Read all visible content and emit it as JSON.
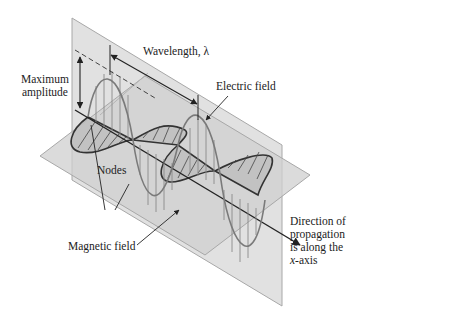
{
  "diagram": {
    "type": "electromagnetic-wave",
    "labels": {
      "wavelength": "Wavelength, λ",
      "max_amplitude_line1": "Maximum",
      "max_amplitude_line2": "amplitude",
      "electric_field": "Electric field",
      "nodes": "Nodes",
      "magnetic_field": "Magnetic field",
      "direction_line1": "Direction of",
      "direction_line2": "propagation",
      "direction_line3": "is along the",
      "direction_axis_var": "x",
      "direction_axis_suffix": "-axis"
    },
    "colors": {
      "background": "#ffffff",
      "plane_fill": "#d9d9d9",
      "plane_edge": "#a8a8a8",
      "electric_wave": "#7a7a7a",
      "magnetic_wave": "#333333",
      "magnetic_fill": "#bdbdbd",
      "axis": "#222222",
      "text": "#222222"
    }
  }
}
